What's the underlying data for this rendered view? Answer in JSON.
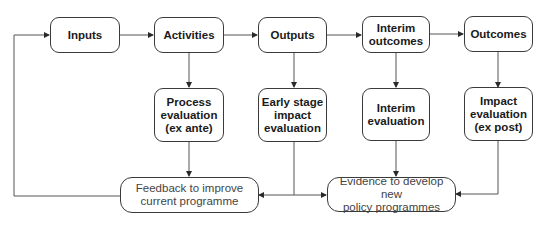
{
  "diagram": {
    "type": "flowchart",
    "stages": [
      {
        "id": "inputs",
        "label": "Inputs"
      },
      {
        "id": "activities",
        "label": "Activities"
      },
      {
        "id": "outputs",
        "label": "Outputs"
      },
      {
        "id": "interim_outcomes",
        "label": "Interim\noutcomes"
      },
      {
        "id": "outcomes",
        "label": "Outcomes"
      }
    ],
    "evaluations": [
      {
        "id": "process_evaluation",
        "label": "Process\nevaluation\n(ex ante)"
      },
      {
        "id": "early_stage_impact_evaluation",
        "label": "Early stage\nimpact\nevaluation"
      },
      {
        "id": "interim_evaluation",
        "label": "Interim\nevaluation"
      },
      {
        "id": "impact_evaluation",
        "label": "Impact\nevaluation\n(ex post)"
      }
    ],
    "results": [
      {
        "id": "feedback",
        "label": "Feedback to improve\ncurrent programme"
      },
      {
        "id": "evidence",
        "label": "Evidence to develop new\npolicy programmes"
      }
    ],
    "edges": [
      {
        "from": "inputs",
        "to": "activities"
      },
      {
        "from": "activities",
        "to": "outputs"
      },
      {
        "from": "outputs",
        "to": "interim_outcomes"
      },
      {
        "from": "interim_outcomes",
        "to": "outcomes"
      },
      {
        "from": "activities",
        "to": "process_evaluation"
      },
      {
        "from": "outputs",
        "to": "early_stage_impact_evaluation"
      },
      {
        "from": "interim_outcomes",
        "to": "interim_evaluation"
      },
      {
        "from": "outcomes",
        "to": "impact_evaluation"
      },
      {
        "from": "process_evaluation",
        "to": "feedback"
      },
      {
        "from": "early_stage_impact_evaluation",
        "to": "feedback"
      },
      {
        "from": "early_stage_impact_evaluation",
        "to": "evidence"
      },
      {
        "from": "interim_evaluation",
        "to": "evidence"
      },
      {
        "from": "impact_evaluation",
        "to": "evidence"
      },
      {
        "from": "feedback",
        "to": "inputs"
      }
    ],
    "colors": {
      "line": "#3a3a3a",
      "box_border": "#3a3a3a",
      "text_dark": "#1a1a1a",
      "text_light": "#444444"
    }
  }
}
